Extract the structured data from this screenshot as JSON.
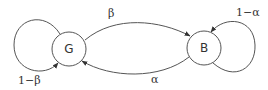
{
  "diagram": {
    "type": "state-transition",
    "nodes": [
      {
        "id": "G",
        "label": "G"
      },
      {
        "id": "B",
        "label": "B"
      }
    ],
    "edges": [
      {
        "from": "G",
        "to": "B",
        "label": "β"
      },
      {
        "from": "B",
        "to": "G",
        "label": "α"
      },
      {
        "from": "G",
        "to": "G",
        "label": "1−β"
      },
      {
        "from": "B",
        "to": "B",
        "label": "1−α"
      }
    ],
    "colors": {
      "stroke": "#555555",
      "text": "#333333"
    }
  }
}
